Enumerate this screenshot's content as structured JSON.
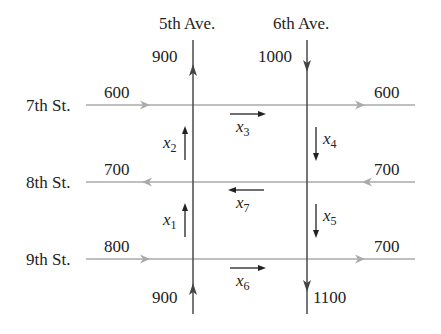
{
  "avenues": [
    {
      "name": "5th Ave.",
      "top_flow": "900",
      "bottom_flow": "900",
      "direction": "north"
    },
    {
      "name": "6th Ave.",
      "top_flow": "1000",
      "bottom_flow": "1100",
      "direction": "south"
    }
  ],
  "streets": [
    {
      "name": "7th St.",
      "left_flow": "600",
      "right_flow": "600",
      "direction": "east"
    },
    {
      "name": "8th St.",
      "left_flow": "700",
      "right_flow": "700",
      "direction": "west"
    },
    {
      "name": "9th St.",
      "left_flow": "800",
      "right_flow": "700",
      "direction": "east"
    }
  ],
  "variables": [
    {
      "id": "x1",
      "base": "x",
      "sub": "1",
      "segment": "5th Ave between 8th and 9th St.",
      "direction": "north"
    },
    {
      "id": "x2",
      "base": "x",
      "sub": "2",
      "segment": "5th Ave between 7th and 8th St.",
      "direction": "north"
    },
    {
      "id": "x3",
      "base": "x",
      "sub": "3",
      "segment": "7th St between 5th and 6th Ave.",
      "direction": "east"
    },
    {
      "id": "x4",
      "base": "x",
      "sub": "4",
      "segment": "6th Ave between 7th and 8th St.",
      "direction": "south"
    },
    {
      "id": "x5",
      "base": "x",
      "sub": "5",
      "segment": "6th Ave between 8th and 9th St.",
      "direction": "south"
    },
    {
      "id": "x6",
      "base": "x",
      "sub": "6",
      "segment": "9th St between 5th and 6th Ave.",
      "direction": "east"
    },
    {
      "id": "x7",
      "base": "x",
      "sub": "7",
      "segment": "8th St between 5th and 6th Ave.",
      "direction": "west"
    }
  ],
  "colors": {
    "avenue_line": "#555555",
    "street_line": "#aaaaaa",
    "arrow": "#222222"
  }
}
